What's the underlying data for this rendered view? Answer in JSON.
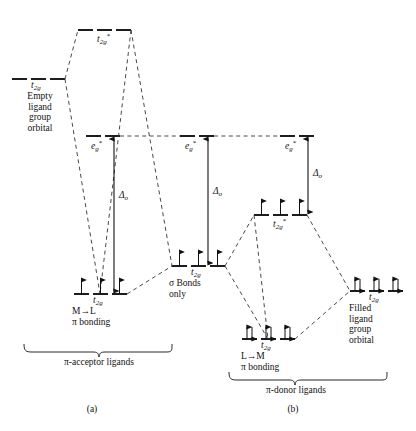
{
  "figure": {
    "type": "molecular-orbital-energy-level-diagram",
    "caption_a": "(a)",
    "caption_b": "(b)"
  },
  "panel_a": {
    "name": "pi-acceptor",
    "bracket_label": "π-acceptor ligands",
    "levels": [
      {
        "id": "ligand-empty-t2g",
        "label": "t",
        "sub": "2g",
        "sup": "",
        "caption": "Empty\nligand\ngroup\norbital",
        "electrons": "none"
      },
      {
        "id": "antibonding-t2g-star",
        "label": "t",
        "sub": "2g",
        "sup": "*",
        "caption": "",
        "electrons": "none"
      },
      {
        "id": "eg-star-a",
        "label": "e",
        "sub": "g",
        "sup": "*",
        "caption": "",
        "electrons": "none"
      },
      {
        "id": "bonding-t2g-a",
        "label": "t",
        "sub": "2g",
        "sup": "",
        "caption": "M→L\nπ bonding",
        "electrons": "three-single"
      }
    ],
    "delta_label": "Δ",
    "delta_sub": "o"
  },
  "panel_sigma": {
    "name": "sigma-only",
    "levels": [
      {
        "id": "eg-star-sigma",
        "label": "e",
        "sub": "g",
        "sup": "*",
        "caption": "",
        "electrons": "none"
      },
      {
        "id": "t2g-sigma",
        "label": "t",
        "sub": "2g",
        "sup": "",
        "caption": "σ Bonds\nonly",
        "electrons": "three-single"
      }
    ],
    "delta_label": "Δ",
    "delta_sub": "o"
  },
  "panel_b": {
    "name": "pi-donor",
    "bracket_label": "π-donor ligands",
    "levels": [
      {
        "id": "eg-star-b",
        "label": "e",
        "sub": "g",
        "sup": "*",
        "caption": "",
        "electrons": "none"
      },
      {
        "id": "antibonding-t2g-star-b",
        "label": "t",
        "sub": "2g",
        "sup": "*",
        "caption": "",
        "electrons": "three-single"
      },
      {
        "id": "ligand-filled-t2g",
        "label": "t",
        "sub": "2g",
        "sup": "",
        "caption": "Filled\nligand\ngroup\norbital",
        "electrons": "three-paired"
      },
      {
        "id": "bonding-t2g-b",
        "label": "t",
        "sub": "2g",
        "sup": "",
        "caption": "L→M\nπ bonding",
        "electrons": "three-paired"
      }
    ],
    "delta_label": "Δ",
    "delta_sub": "o"
  },
  "text": {
    "empty_ligand_l1": "Empty",
    "empty_ligand_l2": "ligand",
    "empty_ligand_l3": "group",
    "empty_ligand_l4": "orbital",
    "filled_ligand_l1": "Filled",
    "filled_ligand_l2": "ligand",
    "filled_ligand_l3": "group",
    "filled_ligand_l4": "orbital",
    "sigma_l1": "σ Bonds",
    "sigma_l2": "only",
    "ml_pi_l1": "M→L",
    "ml_pi_l2": "π bonding",
    "lm_pi_l1": "L→M",
    "lm_pi_l2": "π bonding",
    "pi_acceptor": "π-acceptor ligands",
    "pi_donor": "π-donor ligands",
    "caption_a": "(a)",
    "caption_b": "(b)",
    "t": "t",
    "e": "e",
    "s2g": "2g",
    "sg": "g",
    "star": "*",
    "delta": "Δ",
    "delta_sub": "o"
  },
  "colors": {
    "ink": "#111111",
    "background": "#ffffff",
    "dashed": "#333333"
  }
}
